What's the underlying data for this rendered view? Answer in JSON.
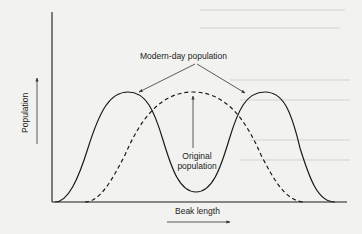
{
  "diagram": {
    "title": "",
    "y_axis_label": "Population",
    "x_axis_label": "Beak length",
    "annotations": {
      "modern": "Modern-day population",
      "original_line1": "Original",
      "original_line2": "population"
    },
    "series": [
      {
        "name": "Modern-day population",
        "style": "solid",
        "shape": "bimodal",
        "peaks_x": [
          "short beak",
          "long beak"
        ]
      },
      {
        "name": "Original population",
        "style": "dashed",
        "shape": "unimodal",
        "peak_x": "intermediate beak"
      }
    ],
    "colors": {
      "line": "#1a1a1a",
      "background": "#f2f2f0",
      "arrow": "#333333"
    }
  }
}
